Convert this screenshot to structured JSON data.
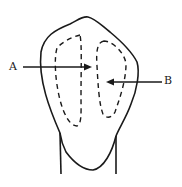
{
  "diagram": {
    "type": "tooth-crown-cross-section",
    "labels": [
      {
        "id": "A",
        "text": "A",
        "target": "left dashed outline (pulp horn)"
      },
      {
        "id": "B",
        "text": "B",
        "target": "right dashed outline (pulp horn)"
      }
    ],
    "colors": {
      "stroke": "#1a1a1a",
      "background": "#ffffff"
    }
  }
}
